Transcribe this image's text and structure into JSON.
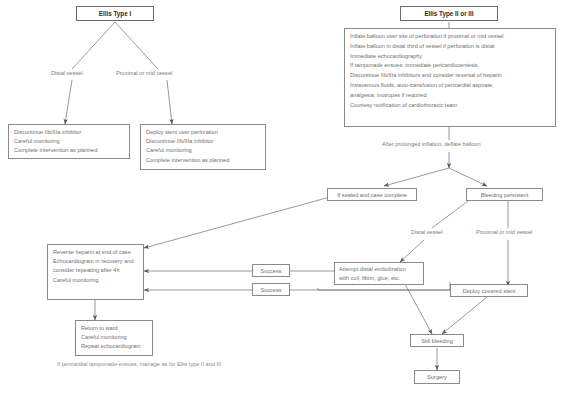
{
  "diagram": {
    "line_color": "#8a8a8a",
    "text_color": "#7b7b7b",
    "heading_color": "#2b2b2b",
    "background": "#ffffff"
  },
  "nodes": {
    "ellis_type_1": {
      "label": "Ellis Type I"
    },
    "ellis_type_2_3": {
      "label": "Ellis Type II or III"
    },
    "type1_distal_box": {
      "lines": [
        "Discontinue IIb/IIIa inhibitor",
        "Careful monitoring",
        "Complete intervention as planned"
      ]
    },
    "type1_proximal_box": {
      "lines": [
        "Deploy stent over perforation",
        "Discontinue IIb/IIIa inhibitor",
        "Careful monitoring",
        "Complete intervention as planned"
      ]
    },
    "type23_actions_box": {
      "lines": [
        "Inflate balloon over site of perforation if proximal or mid vessel",
        "Inflate balloon in distal third of vessel if perforation is distal",
        "Immediate echocardiography",
        "If tamponade ensues: immediate pericardiocentesis",
        "Discontinue IIb/IIIa inhibitors and consider reversal of heparin",
        "Intravenous fluids, auto-transfusion of pericardial aspirate,",
        "analgesia, inotropes if required",
        "Courtesy notification of cardiothoracic team"
      ]
    },
    "sealed_box": {
      "label": "If sealed and case complete"
    },
    "bleeding_box": {
      "label": "Bleeding persistent"
    },
    "reverse_heparin_box": {
      "lines": [
        "Reverse heparin at end of case",
        "Echocardiogram in recovery and",
        "consider repeating after 4h",
        "Careful monitoring"
      ]
    },
    "return_to_ward_box": {
      "lines": [
        "Return to ward",
        "Careful monitoring",
        "Repeat echocardiogram"
      ]
    },
    "success_box_1": {
      "label": "Success"
    },
    "success_box_2": {
      "label": "Success"
    },
    "embolization_box": {
      "lines": [
        "Attempt distal embolization",
        "with coil, fibrin, glue, etc."
      ]
    },
    "covered_stent_box": {
      "label": "Deploy covered stent"
    },
    "still_bleeding_box": {
      "label": "Still bleeding"
    },
    "surgery_box": {
      "label": "Surgery"
    }
  },
  "edge_labels": {
    "type1_distal": "Distal vessel",
    "type1_proximal": "Proximal or mid vessel",
    "bleeding_distal": "Distal vessel",
    "bleeding_proximal": "Proximal or mid vessel"
  },
  "free_text": {
    "deflate_balloon": "After prolonged inflation, deflate balloon"
  },
  "footnote": {
    "text": "If pericardial tamponade ensues, manage as for Ellis type II and III"
  }
}
